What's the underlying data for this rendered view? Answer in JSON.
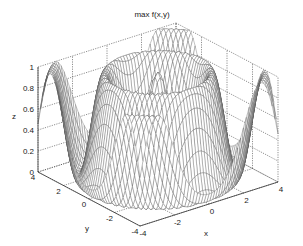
{
  "chart_data": {
    "type": "surface_mesh",
    "title": "max f(x,y)",
    "xlabel": "x",
    "ylabel": "y",
    "zlabel": "z",
    "xlim": [
      -4,
      4
    ],
    "ylim": [
      -4,
      4
    ],
    "zlim": [
      0,
      1
    ],
    "xticks": [
      "-4",
      "-2",
      "0",
      "2",
      "4"
    ],
    "yticks": [
      "-4",
      "-2",
      "0",
      "2",
      "4"
    ],
    "zticks": [
      "0",
      "0.2",
      "0.4",
      "0.6",
      "0.8",
      "1"
    ],
    "grid": true,
    "sample_profile": {
      "r": [
        0,
        1.25,
        2.5,
        3.75,
        5.66
      ],
      "z": [
        1.0,
        0.0,
        1.0,
        0.0,
        0.6
      ]
    },
    "mesh_color": "#555555",
    "grid_color": "#444444"
  }
}
